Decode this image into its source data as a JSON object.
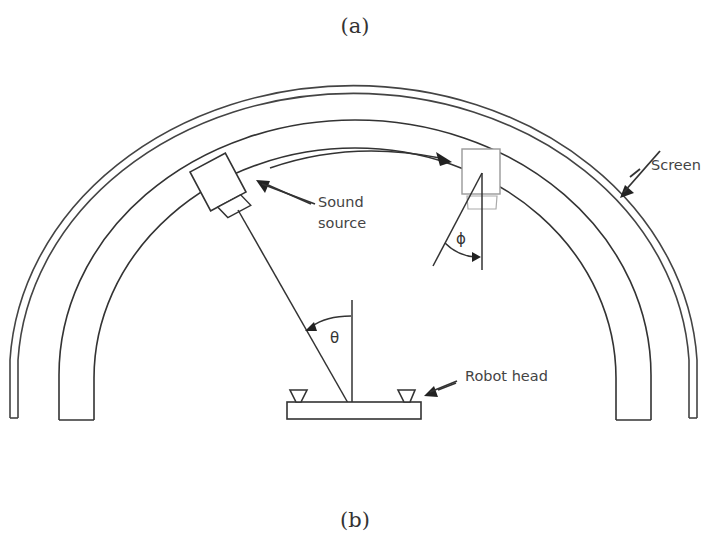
{
  "captions": {
    "top": "(a)",
    "bottom": "(b)"
  },
  "labels": {
    "screen": "Screen",
    "sound_source_line1": "Sound",
    "sound_source_line2": "source",
    "robot_head": "Robot head",
    "theta": "θ",
    "phi": "ϕ"
  },
  "colors": {
    "line": "#333333",
    "light_line": "#999999",
    "background": "#ffffff"
  }
}
